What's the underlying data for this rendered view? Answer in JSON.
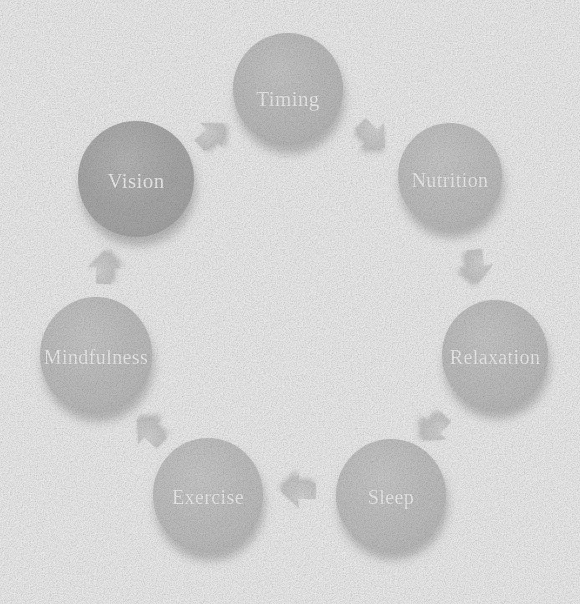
{
  "canvas": {
    "width": 580,
    "height": 604,
    "background_color": "#fdfdfd"
  },
  "diagram": {
    "type": "cycle",
    "direction": "clockwise",
    "node_count": 8,
    "arrow_count": 7,
    "center": {
      "x": 288,
      "y": 303
    },
    "ring_radius": 218,
    "label_color": "#ffffff",
    "node_fill_default": "#c8c8c8",
    "node_fill_highlight": "#b0b0b0",
    "arrow_fill": "#dcdcdc",
    "shadow_color": "#bfbfbf",
    "nodes": [
      {
        "id": "timing",
        "label": "Timing",
        "cx": 288,
        "cy": 89,
        "rx": 55,
        "ry": 56,
        "fill": "#c7c7c7",
        "font_size": 21,
        "label_x": 288,
        "label_y": 99,
        "highlighted": false,
        "order": 1
      },
      {
        "id": "nutrition",
        "label": "Nutrition",
        "cx": 450,
        "cy": 176,
        "rx": 52,
        "ry": 53,
        "fill": "#cacaca",
        "font_size": 20,
        "label_x": 450,
        "label_y": 180,
        "highlighted": false,
        "order": 2
      },
      {
        "id": "relaxation",
        "label": "Relaxation",
        "cx": 495,
        "cy": 355,
        "rx": 53,
        "ry": 55,
        "fill": "#c9c9c9",
        "font_size": 20,
        "label_x": 495,
        "label_y": 357,
        "highlighted": false,
        "order": 3
      },
      {
        "id": "sleep",
        "label": "Sleep",
        "cx": 391,
        "cy": 495,
        "rx": 55,
        "ry": 56,
        "fill": "#cbcbcb",
        "font_size": 20,
        "label_x": 391,
        "label_y": 497,
        "highlighted": false,
        "order": 4
      },
      {
        "id": "exercise",
        "label": "Exercise",
        "cx": 208,
        "cy": 495,
        "rx": 55,
        "ry": 57,
        "fill": "#cbcbcb",
        "font_size": 20,
        "label_x": 208,
        "label_y": 497,
        "highlighted": false,
        "order": 5
      },
      {
        "id": "mindfulness",
        "label": "Mindfulness",
        "cx": 96,
        "cy": 355,
        "rx": 56,
        "ry": 58,
        "fill": "#c9c9c9",
        "font_size": 20,
        "label_x": 96,
        "label_y": 357,
        "highlighted": false,
        "order": 6
      },
      {
        "id": "vision",
        "label": "Vision",
        "cx": 136,
        "cy": 179,
        "rx": 58,
        "ry": 58,
        "fill": "#b0b0b0",
        "font_size": 21,
        "label_x": 136,
        "label_y": 181,
        "highlighted": true,
        "order": 7
      }
    ],
    "arrows": [
      {
        "id": "arrow-vision-timing",
        "from": "vision",
        "to": "timing",
        "x": 211,
        "y": 135,
        "rotation": -42,
        "scale": 0.82
      },
      {
        "id": "arrow-timing-nutrition",
        "from": "timing",
        "to": "nutrition",
        "x": 372,
        "y": 135,
        "rotation": 44,
        "scale": 0.86
      },
      {
        "id": "arrow-nutrition-relaxation",
        "from": "nutrition",
        "to": "relaxation",
        "x": 476,
        "y": 266,
        "rotation": 84,
        "scale": 0.86
      },
      {
        "id": "arrow-relaxation-sleep",
        "from": "relaxation",
        "to": "sleep",
        "x": 435,
        "y": 428,
        "rotation": 134,
        "scale": 0.82
      },
      {
        "id": "arrow-sleep-exercise",
        "from": "sleep",
        "to": "exercise",
        "x": 299,
        "y": 491,
        "rotation": 180,
        "scale": 0.88
      },
      {
        "id": "arrow-exercise-mindfulness",
        "from": "exercise",
        "to": "mindfulness",
        "x": 150,
        "y": 432,
        "rotation": -137,
        "scale": 0.86
      },
      {
        "id": "arrow-mindfulness-vision",
        "from": "mindfulness",
        "to": "vision",
        "x": 104,
        "y": 268,
        "rotation": -88,
        "scale": 0.84
      }
    ]
  }
}
